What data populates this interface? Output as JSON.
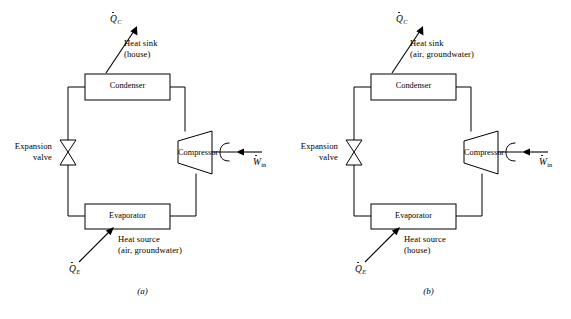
{
  "figure": {
    "kind": "schematic-diagram",
    "background_color": "#ffffff",
    "line_color": "#000000",
    "panel_count": 2
  },
  "components": {
    "condenser_label": "Condenser",
    "evaporator_label": "Evaporator",
    "compressor_label": "Compressor",
    "expansion_valve_line1": "Expansion",
    "expansion_valve_line2": "valve"
  },
  "symbols": {
    "heat_rejected": {
      "base": "Q",
      "subscript": "C",
      "dot": true
    },
    "heat_absorbed": {
      "base": "Q",
      "subscript": "E",
      "dot": true
    },
    "work_input": {
      "base": "W",
      "subscript": "in",
      "dot": true
    }
  },
  "panels": [
    {
      "id": "a",
      "caption": "(a)",
      "heat_sink_line1": "Heat sink",
      "heat_sink_line2": "(house)",
      "heat_source_line1": "Heat source",
      "heat_source_line2": "(air, groundwater)"
    },
    {
      "id": "b",
      "caption": "(b)",
      "heat_sink_line1": "Heat sink",
      "heat_sink_line2": "(air, groundwater)",
      "heat_source_line1": "Heat source",
      "heat_source_line2": "(house)"
    }
  ]
}
